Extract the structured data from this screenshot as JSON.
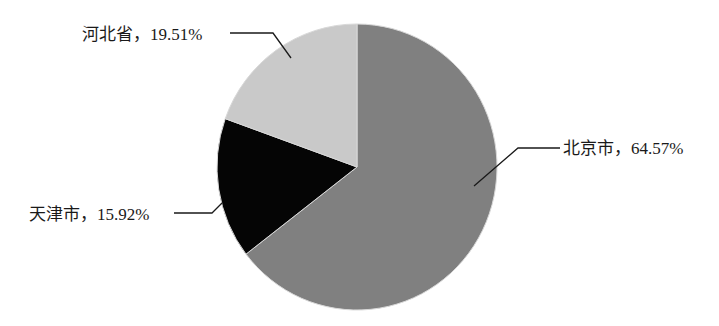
{
  "chart_data": {
    "type": "pie",
    "title": "",
    "categories": [
      "北京市",
      "天津市",
      "河北省"
    ],
    "values": [
      64.57,
      15.92,
      19.51
    ],
    "unit": "%",
    "colors": [
      "#808080",
      "#050505",
      "#c9c9c9"
    ],
    "start_angle_deg": 0,
    "direction": "clockwise",
    "labels": [
      {
        "text": "北京市，64.57%",
        "name": "北京市",
        "value": "64.57%"
      },
      {
        "text": "天津市，15.92%",
        "name": "天津市",
        "value": "15.92%"
      },
      {
        "text": "河北省，19.51%",
        "name": "河北省",
        "value": "19.51%"
      }
    ],
    "legend": "none",
    "data_labels": "outside with leader lines"
  }
}
